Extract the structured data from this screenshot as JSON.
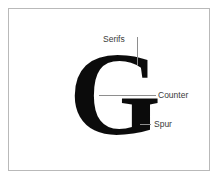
{
  "diagram": {
    "specimen": {
      "glyph": "G",
      "typeface_style": "serif",
      "weight": "bold",
      "color": "#0b0b0b"
    },
    "background_color": "#ffffff",
    "frame_color": "#b9b9b9",
    "leader_line_color": "#8e8e8e",
    "label_color": "#3a3a3a",
    "annotations": [
      {
        "id": "serifs",
        "label": "Serifs",
        "leader": "vertical",
        "points_to": "top terminal serif of the G"
      },
      {
        "id": "counter",
        "label": "Counter",
        "leader": "horizontal",
        "points_to": "enclosed interior space of the bowl"
      },
      {
        "id": "spur",
        "label": "Spur",
        "leader": "horizontal-tick",
        "points_to": "small projection at the base of the stem"
      }
    ]
  }
}
